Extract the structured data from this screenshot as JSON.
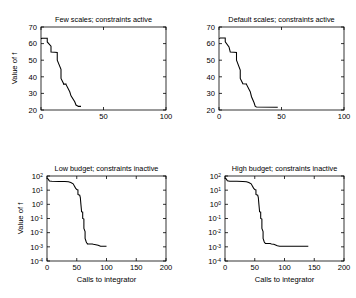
{
  "figure": {
    "background_color": "#ffffff",
    "line_color": "#000000",
    "panel_count": 4
  },
  "chart_data": [
    {
      "id": "few-scales-constraints-active",
      "type": "line",
      "title": "Few scales; constraints active",
      "xlabel": "",
      "ylabel": "Value of f",
      "xlim": [
        0,
        100
      ],
      "ylim": [
        20,
        70
      ],
      "yscale": "linear",
      "xscale": "linear",
      "grid": false,
      "legend": false,
      "xticks": [
        0,
        50,
        100
      ],
      "xticklabels": [
        "0",
        "50",
        "100"
      ],
      "yticks": [
        20,
        30,
        40,
        50,
        60,
        70
      ],
      "yticklabels": [
        "20",
        "30",
        "40",
        "50",
        "60",
        "70"
      ],
      "series": [
        {
          "name": "best f value",
          "x": [
            0,
            1,
            3,
            5,
            5,
            8,
            8,
            11,
            11,
            13,
            13,
            16,
            16,
            18,
            18,
            20,
            20,
            23,
            24,
            27,
            28,
            30,
            32
          ],
          "y": [
            63.0,
            63.2,
            63.2,
            63.2,
            61.0,
            58.5,
            55.0,
            54.8,
            54.8,
            54.6,
            50.0,
            44.5,
            39.0,
            36.0,
            35.6,
            35.6,
            35.4,
            31.0,
            28.5,
            25.0,
            23.0,
            22.2,
            22.2
          ]
        }
      ]
    },
    {
      "id": "default-scales-constraints-active",
      "type": "line",
      "title": "Default scales; constraints active",
      "xlabel": "",
      "ylabel": "",
      "xlim": [
        0,
        100
      ],
      "ylim": [
        20,
        70
      ],
      "yscale": "linear",
      "xscale": "linear",
      "grid": false,
      "legend": false,
      "xticks": [
        0,
        50,
        100
      ],
      "xticklabels": [
        "0",
        "50",
        "100"
      ],
      "yticks": [
        20,
        30,
        40,
        50,
        60,
        70
      ],
      "yticklabels": [
        "20",
        "30",
        "40",
        "50",
        "60",
        "70"
      ],
      "series": [
        {
          "name": "best f value",
          "x": [
            0,
            1,
            3,
            5,
            5,
            8,
            9,
            12,
            12,
            14,
            14,
            17,
            17,
            19,
            19,
            22,
            22,
            25,
            26,
            28,
            29,
            30,
            47
          ],
          "y": [
            63.0,
            63.4,
            63.4,
            63.4,
            61.0,
            58.0,
            55.0,
            54.8,
            54.8,
            54.6,
            50.0,
            44.0,
            39.0,
            36.0,
            35.8,
            35.6,
            35.4,
            31.0,
            28.0,
            24.5,
            22.2,
            21.8,
            21.6
          ]
        }
      ]
    },
    {
      "id": "low-budget-constraints-inactive",
      "type": "line",
      "title": "Low budget; constraints inactive",
      "xlabel": "Calls to integrator",
      "ylabel": "Value of f",
      "xlim": [
        0,
        200
      ],
      "ylim": [
        0.0001,
        100
      ],
      "yscale": "log",
      "xscale": "linear",
      "grid": false,
      "legend": false,
      "xticks": [
        0,
        50,
        100,
        150,
        200
      ],
      "xticklabels": [
        "0",
        "50",
        "100",
        "150",
        "200"
      ],
      "yticks": [
        0.0001,
        0.001,
        0.01,
        0.1,
        1,
        10,
        100
      ],
      "yticklabels": [
        "10^-4",
        "10^-3",
        "10^-2",
        "10^-1",
        "10^0",
        "10^1",
        "10^2"
      ],
      "series": [
        {
          "name": "best f value",
          "x": [
            0,
            2,
            4,
            8,
            20,
            30,
            36,
            40,
            44,
            46,
            48,
            50,
            52,
            52,
            54,
            55,
            56,
            57,
            58,
            58,
            60,
            60,
            62,
            62,
            64,
            64,
            66,
            67,
            68,
            68,
            76,
            78,
            82,
            86,
            88,
            90,
            92,
            100
          ],
          "y": [
            70.0,
            60.0,
            45.0,
            42.0,
            41.5,
            41.0,
            39.0,
            35.0,
            28.0,
            20.0,
            14.0,
            11.0,
            10.5,
            5.0,
            4.6,
            4.4,
            3.0,
            1.0,
            0.35,
            0.3,
            0.28,
            0.1,
            0.09,
            0.02,
            0.012,
            0.004,
            0.0022,
            0.0018,
            0.0017,
            0.0016,
            0.0016,
            0.0015,
            0.0014,
            0.0013,
            0.0012,
            0.0011,
            0.0011,
            0.0011
          ]
        }
      ]
    },
    {
      "id": "high-budget-constraints-inactive",
      "type": "line",
      "title": "High budget; constraints inactive",
      "xlabel": "Calls to integrator",
      "ylabel": "",
      "xlim": [
        0,
        200
      ],
      "ylim": [
        0.0001,
        100
      ],
      "yscale": "log",
      "xscale": "linear",
      "grid": false,
      "legend": false,
      "xticks": [
        0,
        50,
        100,
        150,
        200
      ],
      "xticklabels": [
        "0",
        "50",
        "100",
        "150",
        "200"
      ],
      "yticks": [
        0.0001,
        0.001,
        0.01,
        0.1,
        1,
        10,
        100
      ],
      "yticklabels": [
        "10^-4",
        "10^-3",
        "10^-2",
        "10^-1",
        "10^0",
        "10^1",
        "10^2"
      ],
      "series": [
        {
          "name": "best f value",
          "x": [
            0,
            2,
            4,
            8,
            20,
            30,
            36,
            40,
            44,
            46,
            48,
            50,
            52,
            52,
            54,
            55,
            56,
            57,
            58,
            58,
            60,
            60,
            62,
            62,
            64,
            64,
            66,
            67,
            68,
            68,
            76,
            78,
            82,
            86,
            88,
            92,
            100,
            120,
            140
          ],
          "y": [
            72.0,
            62.0,
            46.0,
            43.0,
            42.0,
            41.5,
            39.5,
            35.0,
            28.0,
            20.0,
            14.0,
            11.0,
            10.5,
            5.0,
            4.6,
            4.4,
            3.0,
            1.0,
            0.35,
            0.3,
            0.28,
            0.1,
            0.09,
            0.02,
            0.012,
            0.004,
            0.0022,
            0.0019,
            0.0018,
            0.0017,
            0.0017,
            0.0016,
            0.0015,
            0.0013,
            0.0012,
            0.0011,
            0.0011,
            0.0011,
            0.0011
          ]
        }
      ]
    }
  ]
}
